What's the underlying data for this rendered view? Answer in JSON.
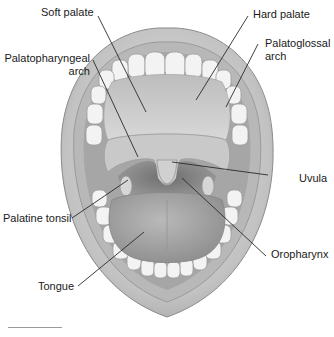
{
  "figure": {
    "labels": {
      "soft_palate": "Soft palate",
      "hard_palate": "Hard palate",
      "palatopharyngeal_arch_line1": "Palatopharyngeal",
      "palatopharyngeal_arch_line2": "arch",
      "palatoglossal_arch_line1": "Palatoglossal",
      "palatoglossal_arch_line2": "arch",
      "uvula": "Uvula",
      "palatine_tonsil": "Palatine tonsil",
      "oropharynx": "Oropharynx",
      "tongue": "Tongue"
    },
    "colors": {
      "lip_outer": "#c9c9c9",
      "lip_inner": "#b4b4b4",
      "teeth": "#f2f2f2",
      "palate": "#cfcfcf",
      "throat": "#8f8f8f",
      "tongue": "#a8a8a8",
      "leader_line": "#2a2a2a",
      "text": "#1a1a1a"
    }
  }
}
